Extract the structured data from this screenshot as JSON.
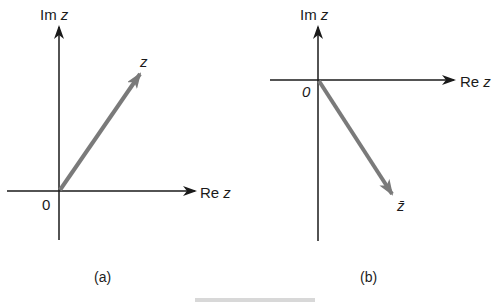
{
  "panels": [
    {
      "id": "a",
      "caption": "(a)",
      "vertical_axis_label": {
        "prefix": "Im ",
        "var": "z"
      },
      "horizontal_axis_label": {
        "prefix": "Re ",
        "var": "z"
      },
      "origin_label": "0",
      "vector_label": "z",
      "vector": {
        "from": [
          0,
          0
        ],
        "to": [
          1,
          1.45
        ],
        "description": "z in first quadrant"
      }
    },
    {
      "id": "b",
      "caption": "(b)",
      "vertical_axis_label": {
        "prefix": "Im ",
        "var": "z"
      },
      "horizontal_axis_label": {
        "prefix": "Re ",
        "var": "z"
      },
      "origin_label": "0",
      "vector_label": "z̄",
      "vector": {
        "from": [
          0,
          0
        ],
        "to": [
          1,
          -1.45
        ],
        "description": "conjugate of z in fourth quadrant"
      }
    }
  ],
  "colors": {
    "axis": "#1a1a1a",
    "vector": "#7a7a7a"
  }
}
